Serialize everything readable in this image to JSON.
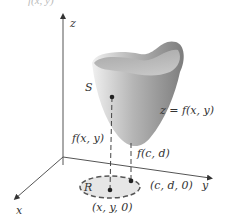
{
  "figure": {
    "title_fragment": "f(x, y)",
    "axes": {
      "x": "x",
      "y": "y",
      "z": "z"
    },
    "labels": {
      "surface": "S",
      "equation": "z = f(x, y)",
      "height_xy": "f(x, y)",
      "height_cd": "f(c, d)",
      "region": "R",
      "point_cd0": "(c, d, 0)",
      "point_xy0": "(x, y, 0)"
    },
    "colors": {
      "surface_light": "#e0e0e0",
      "surface_dark": "#8a8a8a",
      "region_fill": "#e6e6e6",
      "axis": "#444444"
    }
  }
}
